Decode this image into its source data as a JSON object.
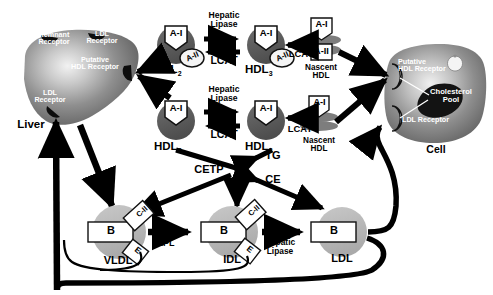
{
  "diagram": {
    "organs": {
      "liver": {
        "label": "Liver",
        "receptors": [
          {
            "name": "remnant-receptor",
            "label": "Remnant\nReceptor"
          },
          {
            "name": "ldl-receptor-top",
            "label": "LDL\nReceptor"
          },
          {
            "name": "putative-hdl-receptor",
            "label": "Putative\nHDL Receptor"
          },
          {
            "name": "ldl-receptor-lower",
            "label": "LDL\nReceptor"
          }
        ]
      },
      "cell": {
        "label": "Cell",
        "receptors": [
          {
            "name": "putative-hdl-receptor",
            "label": "Putative\nHDL Receptor"
          },
          {
            "name": "ldl-receptor",
            "label": "LDL Receptor"
          }
        ],
        "cholesterol_pool": "Cholesterol\nPool"
      }
    },
    "particles": {
      "hdl2_upper": {
        "label": "HDL",
        "subscript": "2",
        "apos": [
          "A-I",
          "A-II"
        ]
      },
      "hdl3_upper": {
        "label": "HDL",
        "subscript": "3",
        "apos": [
          "A-I",
          "A-II"
        ]
      },
      "hdl2_lower": {
        "label": "HDL",
        "subscript": "2",
        "apos": [
          "A-I"
        ]
      },
      "hdl3_lower": {
        "label": "HDL",
        "subscript": "3",
        "apos": [
          "A-I"
        ]
      },
      "nascent_hdl_upper": {
        "label": "Nascent\nHDL",
        "apos": [
          "A-I",
          "A-II"
        ]
      },
      "nascent_hdl_lower": {
        "label": "Nascent\nHDL",
        "apos": [
          "A-I"
        ]
      },
      "vldl": {
        "label": "VLDL",
        "apos": [
          "B",
          "C-II",
          "E"
        ]
      },
      "idl": {
        "label": "IDL",
        "apos": [
          "B",
          "C-II",
          "E"
        ]
      },
      "ldl": {
        "label": "LDL",
        "apos": [
          "B"
        ]
      }
    },
    "enzymes": {
      "hepatic_lipase_1": "Hepatic\nLipase",
      "lcat_1": "LCAT",
      "hepatic_lipase_2": "Hepatic\nLipase",
      "lcat_2": "LCAT",
      "lcat_3": "LCAT",
      "lcat_4": "LCAT",
      "cetp": "CETP",
      "lpl": "LPL",
      "hepatic_lipase_3": "Hepatic\nLipase"
    },
    "lipids": {
      "tg": "TG",
      "ce": "CE"
    },
    "colors": {
      "particle_dark": "#5b5b5b",
      "particle_light": "#b8b8b8",
      "arrow": "#000000",
      "organ_fill": "#8a8a8a",
      "cholesterol_pool": "#151515",
      "background": "#ffffff"
    }
  }
}
